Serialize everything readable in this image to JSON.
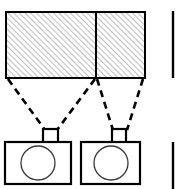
{
  "figure": {
    "type": "technical-line-diagram",
    "canvas": {
      "width": 181,
      "height": 189
    },
    "colors": {
      "background": "#ffffff",
      "stroke": "#000000",
      "hatch": "#8c8c8c",
      "lens_stroke": "#3a3a3a"
    },
    "scene_plane": {
      "label": "",
      "x": 6,
      "y": 12,
      "width": 139,
      "height": 66,
      "stroke_width": 2,
      "hatch_pattern": "diagonal-45-up",
      "hatch_spacing": 4,
      "divider_x": 96,
      "divider_stroke_width": 2,
      "regions": [
        {
          "name": "left-coverage-region",
          "label": "",
          "x": 6,
          "width": 90
        },
        {
          "name": "right-coverage-region",
          "label": "",
          "x": 96,
          "width": 49
        }
      ]
    },
    "view_rays": {
      "style": "dashed",
      "dash_pattern": "7 5",
      "stroke_width": 2.6,
      "lines": [
        {
          "name": "left-camera-ray-outer",
          "x1": 8,
          "y1": 79,
          "x2": 45,
          "y2": 130
        },
        {
          "name": "left-camera-ray-inner",
          "x1": 95,
          "y1": 79,
          "x2": 57,
          "y2": 130
        },
        {
          "name": "right-camera-ray-outer",
          "x1": 97,
          "y1": 79,
          "x2": 113,
          "y2": 130
        },
        {
          "name": "right-camera-ray-inner",
          "x1": 143,
          "y1": 79,
          "x2": 127,
          "y2": 130
        }
      ]
    },
    "cameras": [
      {
        "name": "camera-left",
        "label": "",
        "body": {
          "x": 5,
          "y": 142,
          "width": 66,
          "height": 42
        },
        "viewfinder": {
          "x": 43,
          "y": 129,
          "width": 15,
          "height": 13
        },
        "lens": {
          "cx": 38,
          "cy": 163,
          "r": 17
        },
        "stroke_width": 2.2
      },
      {
        "name": "camera-right",
        "label": "",
        "body": {
          "x": 81,
          "y": 142,
          "width": 59,
          "height": 42
        },
        "viewfinder": {
          "x": 112,
          "y": 129,
          "width": 14,
          "height": 13
        },
        "lens": {
          "cx": 111,
          "cy": 163,
          "r": 17
        },
        "stroke_width": 2.2
      }
    ],
    "cropped_neighbors": [
      {
        "name": "neighbor-figure-edge-top",
        "x": 173,
        "y": 11,
        "height": 67,
        "stroke_width": 2.4
      },
      {
        "name": "neighbor-figure-edge-bottom",
        "x": 173,
        "y": 142,
        "height": 47,
        "stroke_width": 2.4
      }
    ]
  }
}
